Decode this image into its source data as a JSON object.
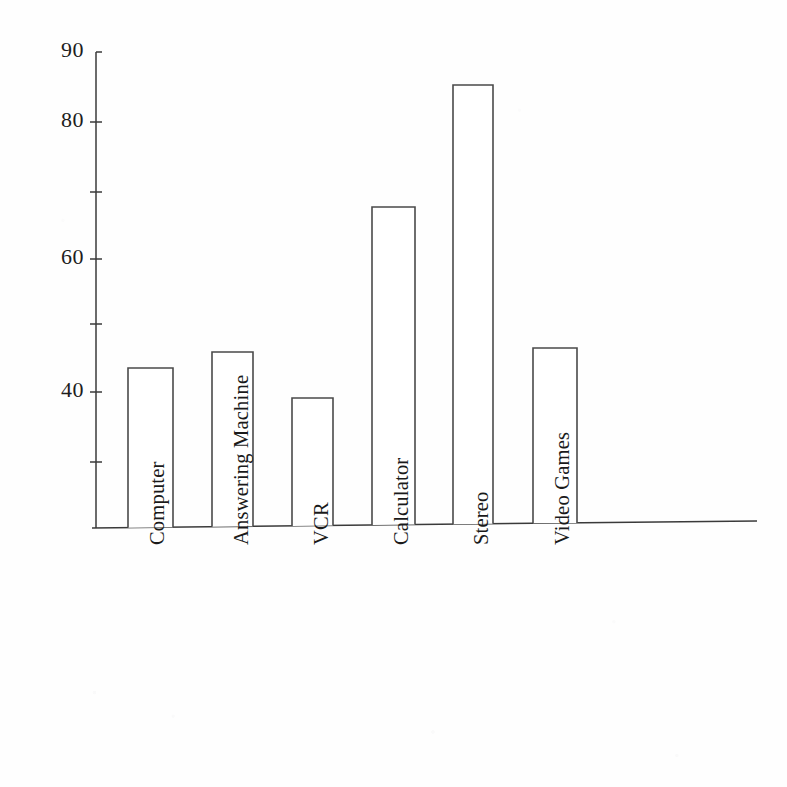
{
  "chart_data": {
    "type": "bar",
    "title": "",
    "subtitle": "",
    "xlabel": "",
    "ylabel": "",
    "categories": [
      "Computer",
      "Answering Machine",
      "VCR",
      "Calculator",
      "Stereo",
      "Video Games"
    ],
    "values": [
      44,
      46,
      39.5,
      68,
      85,
      47
    ],
    "series": [
      {
        "name": "",
        "values": [
          44,
          46,
          39.5,
          68,
          85,
          47
        ]
      }
    ],
    "ylim": [
      25,
      90
    ],
    "ytick_values": [
      90,
      80,
      70,
      60,
      50,
      40,
      30
    ],
    "ytick_labels": [
      "90",
      "80",
      "",
      "60",
      "",
      "40",
      ""
    ],
    "ytick_labeled": [
      "90",
      "80",
      "60",
      "40"
    ],
    "grid": false,
    "legend": false,
    "legend_position": "none",
    "bar_style": {
      "fill": "#ffffff",
      "stroke": "#4a4a4a",
      "stroke_width": 1.6
    },
    "axis_color": "#3a3a3a",
    "background": "#fefefe",
    "label_rotation": -90
  },
  "geometry": {
    "axis_x": 96,
    "axis_top_y": 52,
    "baseline_left_y": 528,
    "baseline_right_y": 521,
    "axis_right_x": 757,
    "px_per_unit": 7.0,
    "value_at_axis_top": 90,
    "bars": [
      {
        "category": "Computer",
        "x0": 128,
        "x1": 173,
        "top_y": 368,
        "label_x": 146,
        "label_y": 545
      },
      {
        "category": "Answering Machine",
        "x0": 212,
        "x1": 253,
        "top_y": 352,
        "label_x": 230,
        "label_y": 545
      },
      {
        "category": "VCR",
        "x0": 292,
        "x1": 333,
        "top_y": 398,
        "label_x": 310,
        "label_y": 545
      },
      {
        "category": "Calculator",
        "x0": 372,
        "x1": 415,
        "top_y": 207,
        "label_x": 390,
        "label_y": 545
      },
      {
        "category": "Stereo",
        "x0": 453,
        "x1": 493,
        "top_y": 85,
        "label_x": 470,
        "label_y": 545
      },
      {
        "category": "Video Games",
        "x0": 533,
        "x1": 577,
        "top_y": 348,
        "label_x": 551,
        "label_y": 545
      }
    ],
    "yticks": [
      {
        "value": 90,
        "y": 52,
        "labeled": true,
        "half": true
      },
      {
        "value": 80,
        "y": 122,
        "labeled": true,
        "half": false
      },
      {
        "value": 70,
        "y": 192,
        "labeled": false,
        "half": false
      },
      {
        "value": 60,
        "y": 259,
        "labeled": true,
        "half": false
      },
      {
        "value": 50,
        "y": 324,
        "labeled": false,
        "half": false
      },
      {
        "value": 40,
        "y": 392,
        "labeled": true,
        "half": false
      },
      {
        "value": 30,
        "y": 462,
        "labeled": false,
        "half": false
      }
    ]
  }
}
